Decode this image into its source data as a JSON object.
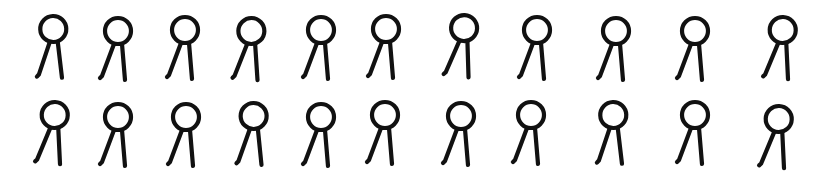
{
  "canvas": {
    "width": 827,
    "height": 173,
    "background": "#ffffff",
    "ink": "#111111"
  },
  "glyph_icon": "ring-with-two-legs",
  "rows": [
    {
      "name": "row-1",
      "glyphs": [
        {
          "cx": 54,
          "top": 14,
          "tilt": -2
        },
        {
          "cx": 118,
          "top": 16,
          "tilt": 0
        },
        {
          "cx": 185,
          "top": 15,
          "tilt": 0
        },
        {
          "cx": 251,
          "top": 16,
          "tilt": 1
        },
        {
          "cx": 321,
          "top": 15,
          "tilt": 0
        },
        {
          "cx": 386,
          "top": 14,
          "tilt": 0
        },
        {
          "cx": 463,
          "top": 13,
          "tilt": 3
        },
        {
          "cx": 537,
          "top": 15,
          "tilt": 0
        },
        {
          "cx": 616,
          "top": 16,
          "tilt": 0
        },
        {
          "cx": 695,
          "top": 16,
          "tilt": 0
        },
        {
          "cx": 782,
          "top": 15,
          "tilt": 2
        }
      ]
    },
    {
      "name": "row-2",
      "glyphs": [
        {
          "cx": 54,
          "top": 100,
          "tilt": 2
        },
        {
          "cx": 118,
          "top": 102,
          "tilt": 0
        },
        {
          "cx": 186,
          "top": 102,
          "tilt": 0
        },
        {
          "cx": 254,
          "top": 101,
          "tilt": -1
        },
        {
          "cx": 321,
          "top": 102,
          "tilt": 0
        },
        {
          "cx": 385,
          "top": 100,
          "tilt": 0
        },
        {
          "cx": 461,
          "top": 101,
          "tilt": 0
        },
        {
          "cx": 531,
          "top": 100,
          "tilt": 0
        },
        {
          "cx": 614,
          "top": 100,
          "tilt": -2
        },
        {
          "cx": 695,
          "top": 100,
          "tilt": 0
        },
        {
          "cx": 778,
          "top": 104,
          "tilt": 2
        }
      ]
    }
  ]
}
